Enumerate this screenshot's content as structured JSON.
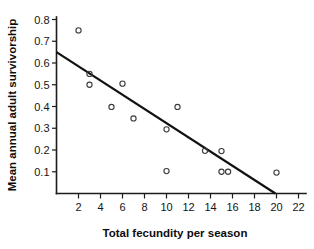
{
  "chart_data": {
    "type": "scatter",
    "title": "",
    "xlabel": "Total fecundity per season",
    "ylabel": "Mean annual adult survivorship",
    "xlim": [
      0,
      22.8
    ],
    "ylim": [
      0,
      0.8
    ],
    "xticks": [
      2,
      4,
      6,
      8,
      10,
      12,
      14,
      16,
      18,
      20,
      22
    ],
    "xtick_labels": [
      "2",
      "4",
      "6",
      "8",
      "10",
      "12",
      "14",
      "16",
      "18",
      "20",
      "22"
    ],
    "yticks": [
      0.1,
      0.2,
      0.3,
      0.4,
      0.5,
      0.6,
      0.7,
      0.8
    ],
    "ytick_labels": [
      "0.1",
      "0.2",
      "0.3",
      "0.4",
      "0.5",
      "0.6",
      "0.7",
      "0.8"
    ],
    "grid": false,
    "legend": null,
    "marker": "open-circle",
    "points": [
      {
        "x": 2.0,
        "y": 0.75
      },
      {
        "x": 3.0,
        "y": 0.55
      },
      {
        "x": 3.0,
        "y": 0.5
      },
      {
        "x": 5.0,
        "y": 0.398
      },
      {
        "x": 6.0,
        "y": 0.505
      },
      {
        "x": 7.0,
        "y": 0.345
      },
      {
        "x": 10.0,
        "y": 0.295
      },
      {
        "x": 10.0,
        "y": 0.103
      },
      {
        "x": 11.0,
        "y": 0.398
      },
      {
        "x": 13.5,
        "y": 0.196
      },
      {
        "x": 15.0,
        "y": 0.195
      },
      {
        "x": 15.0,
        "y": 0.1
      },
      {
        "x": 15.6,
        "y": 0.1
      },
      {
        "x": 20.0,
        "y": 0.096
      }
    ],
    "series": [
      {
        "name": "regression-line",
        "type": "line",
        "x": [
          0,
          19.9
        ],
        "y": [
          0.65,
          0.0
        ]
      }
    ]
  },
  "colors": {
    "axis": "#1c1c1c",
    "marker_stroke": "#3a3a3a",
    "fit_line": "#111111",
    "background": "#ffffff",
    "text": "#141414"
  }
}
